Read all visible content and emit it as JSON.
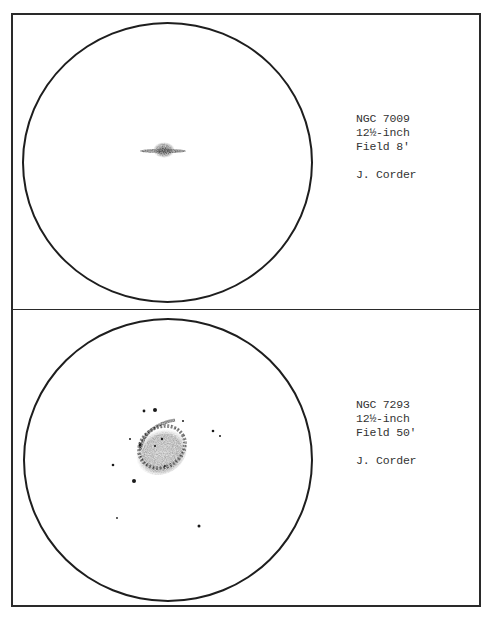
{
  "panels": [
    {
      "object": "NGC 7009",
      "aperture": "12½-inch",
      "field": "Field 8'",
      "observer": "J. Corder",
      "circle": {
        "cx": 167,
        "cy": 162,
        "r": 145
      }
    },
    {
      "object": "NGC 7293",
      "aperture": "12½-inch",
      "field": "Field 50'",
      "observer": "J. Corder",
      "circle": {
        "cx": 167,
        "cy": 460,
        "r": 144
      }
    }
  ],
  "colors": {
    "ink": "#1e1e1e",
    "text": "#333333",
    "nebula": "#8a8a8a",
    "paper": "#ffffff"
  }
}
